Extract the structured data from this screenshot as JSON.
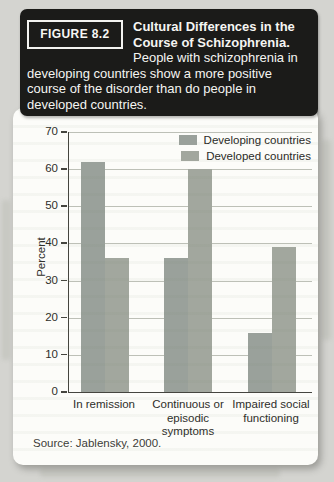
{
  "header": {
    "figure_label": "FIGURE 8.2",
    "title_bold": "Cultural Differences in the Course of Schizophrenia.",
    "description": "People with schizophrenia in developing countries show a more positive course of the disorder than do people in developed countries.",
    "background_color": "#1b1b19",
    "text_color": "#f5f5f2"
  },
  "chart_data": {
    "type": "bar",
    "title": "",
    "xlabel": "",
    "ylabel": "Percent",
    "ylim": [
      0,
      70
    ],
    "yticks": [
      0,
      10,
      20,
      30,
      40,
      50,
      60,
      70
    ],
    "grid": true,
    "legend_position": "top-right",
    "categories": [
      "In remission",
      "Continuous or episodic symptoms",
      "Impaired social functioning"
    ],
    "series": [
      {
        "name": "Developing countries",
        "color": "#9aa19b",
        "values": [
          62,
          36,
          16
        ]
      },
      {
        "name": "Developed countries",
        "color": "#a2a79e",
        "values": [
          36,
          60,
          39
        ]
      }
    ]
  },
  "source": "Source: Jablensky, 2000.",
  "colors": {
    "page_background": "#d4d4d0",
    "card_background": "#fcfcf9",
    "gridline": "#bdc0b7",
    "axis": "#45453f"
  }
}
